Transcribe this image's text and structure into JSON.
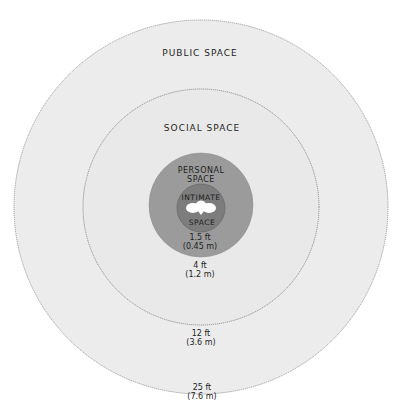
{
  "diagram": {
    "zones": [
      {
        "id": "public",
        "label": "PUBLIC SPACE",
        "distance_ft": "25 ft",
        "distance_m": "(7.6 m)",
        "fill": "#ececec"
      },
      {
        "id": "social",
        "label": "SOCIAL SPACE",
        "distance_ft": "12 ft",
        "distance_m": "(3.6 m)",
        "fill": "#e9e9e9"
      },
      {
        "id": "personal",
        "label_line1": "PERSONAL",
        "label_line2": "SPACE",
        "distance_ft": "4 ft",
        "distance_m": "(1.2 m)",
        "fill": "#9b9b9b"
      },
      {
        "id": "intimate",
        "label_line1": "INTIMATE",
        "label_line2": "SPACE",
        "distance_ft": "1.5 ft",
        "distance_m": "(0.45 m)",
        "fill": "#7d7d7d"
      }
    ],
    "center_icon": "people-top-view-icon",
    "colors": {
      "outline": "#8a8a8a",
      "text": "#1e1e1e",
      "figure": "#ffffff"
    }
  }
}
